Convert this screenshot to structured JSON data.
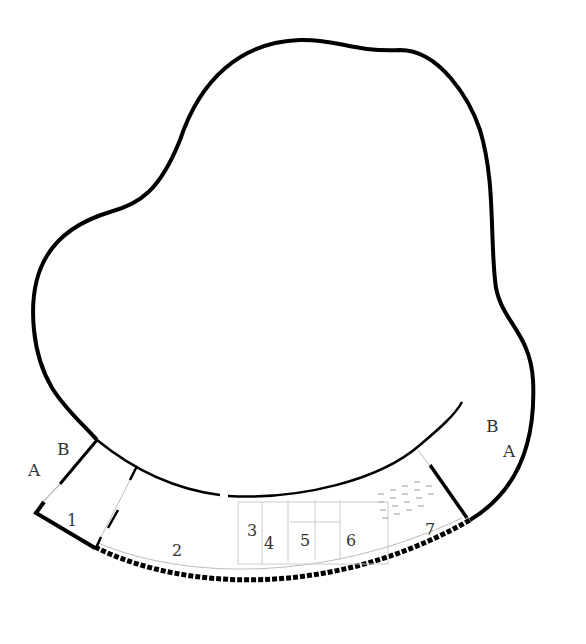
{
  "diagram": {
    "type": "architectural floor plan",
    "colors": {
      "wall": "#000000",
      "light_line": "#bbbbbb",
      "background": "#ffffff",
      "text": "#333333"
    },
    "section_marks": [
      {
        "id": "left-A",
        "label": "A"
      },
      {
        "id": "left-B",
        "label": "B"
      },
      {
        "id": "right-B",
        "label": "B"
      },
      {
        "id": "right-A",
        "label": "A"
      }
    ],
    "rooms": [
      {
        "number": "1"
      },
      {
        "number": "2"
      },
      {
        "number": "3"
      },
      {
        "number": "4"
      },
      {
        "number": "5"
      },
      {
        "number": "6"
      },
      {
        "number": "7"
      }
    ]
  }
}
